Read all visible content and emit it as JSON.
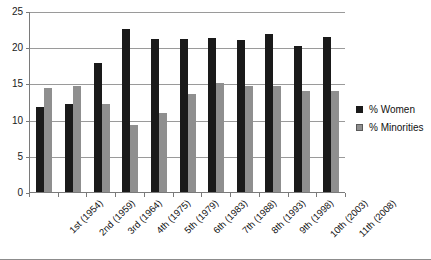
{
  "chart_data": {
    "type": "bar",
    "title": "",
    "subtitle": "",
    "xlabel": "",
    "ylabel": "",
    "ylim": [
      0,
      25
    ],
    "yticks": [
      0,
      5,
      10,
      15,
      20,
      25
    ],
    "grid": true,
    "legend_position": "right",
    "categories": [
      "1st (1954)",
      "2nd (1959)",
      "3rd (1964)",
      "4th (1975)",
      "5th (1979)",
      "6th (1983)",
      "7th (1988)",
      "8th (1993)",
      "9th (1998)",
      "10th (2003)",
      "11th (2008)"
    ],
    "series": [
      {
        "name": "% Women",
        "color": "#1a1a1a",
        "values": [
          11.8,
          12.1,
          17.8,
          22.5,
          21.1,
          21.1,
          21.3,
          21.0,
          21.8,
          20.1,
          21.4
        ]
      },
      {
        "name": "% Minorities",
        "color": "#8f8f8f",
        "values": [
          14.3,
          14.7,
          12.2,
          9.3,
          10.9,
          13.6,
          15.1,
          14.7,
          14.6,
          13.9,
          13.9
        ]
      }
    ]
  },
  "legend": {
    "items": [
      {
        "label": "% Women",
        "swatch": "black-square-marker"
      },
      {
        "label": "% Minorities",
        "swatch": "gray-square-marker"
      }
    ]
  }
}
